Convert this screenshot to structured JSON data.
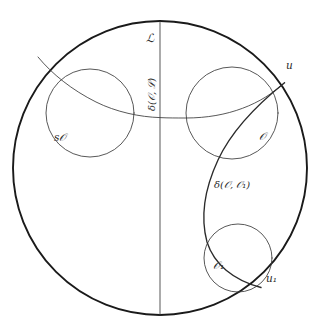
{
  "figure": {
    "kind": "geometric-diagram",
    "background_color": "#ffffff",
    "ink_color": "#1a1a1a",
    "thin_ink_color": "#3a3a3a",
    "canvas": {
      "width": 320,
      "height": 335
    }
  },
  "labels": {
    "line_L": "ℒ",
    "point_u": "u",
    "point_u1": "u₁",
    "horoball_sO": "s𝒪",
    "horoball_O": "𝒪",
    "horoball_O1": "𝒪₁",
    "distance_O_L": "δ(𝒪, ℒ)",
    "distance_O_O1": "δ(𝒪, 𝒪₁)"
  },
  "geometry": {
    "boundary_circle": {
      "cx": 160,
      "cy": 168,
      "r": 147
    },
    "vertical_line_L": {
      "x": 160,
      "y1": 21,
      "y2": 316
    },
    "circle_sO": {
      "cx": 90,
      "cy": 113,
      "r": 44
    },
    "circle_O": {
      "cx": 232,
      "cy": 113,
      "r": 46
    },
    "circle_O1": {
      "cx": 238,
      "cy": 258,
      "r": 34
    },
    "arc_through_u_to_left": "horocyclic arc from u sweeping left across both upper circles",
    "arc_u_to_u1": "geodesic arc joining u and u₁"
  }
}
